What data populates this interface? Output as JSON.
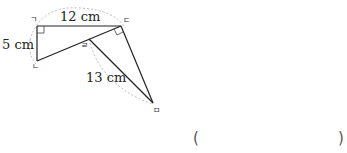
{
  "figure": {
    "points": {
      "giyeok": "ㄱ",
      "nieun": "ㄴ",
      "digeut": "ㄷ",
      "rieul": "ㄹ",
      "mieum": "ㅁ"
    },
    "lengths": {
      "top": "12 cm",
      "left": "5 cm",
      "diagonal": "13 cm"
    },
    "colors": {
      "line": "#222222",
      "dotted_arc": "#bbbbbb"
    }
  },
  "answer": {
    "open": "(",
    "close": ")"
  }
}
